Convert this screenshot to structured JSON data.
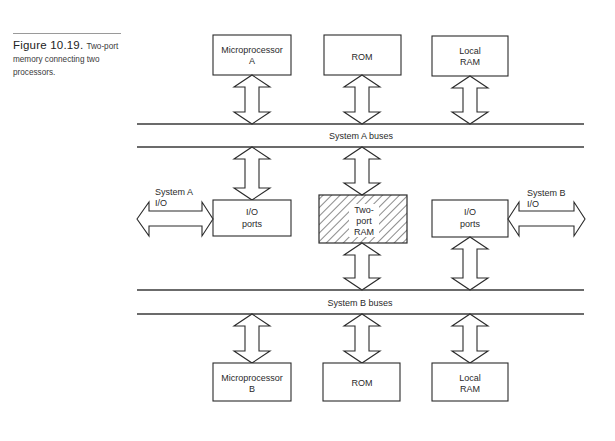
{
  "caption": {
    "figure_number": "Figure 10.19.",
    "text": "Two-port memory connecting two processors."
  },
  "buses": {
    "system_a": "System A buses",
    "system_b": "System B buses"
  },
  "top_row": {
    "microprocessor": [
      "Microprocessor",
      "A"
    ],
    "rom": "ROM",
    "local_ram": [
      "Local",
      "RAM"
    ]
  },
  "middle_row": {
    "io_ports_a": [
      "I/O",
      "ports"
    ],
    "two_port_ram": [
      "Two-",
      "port",
      "RAM"
    ],
    "io_ports_b": [
      "I/O",
      "ports"
    ],
    "system_a_io": [
      "System A",
      "I/O"
    ],
    "system_b_io": [
      "System B",
      "I/O"
    ]
  },
  "bottom_row": {
    "microprocessor": [
      "Microprocessor",
      "B"
    ],
    "rom": "ROM",
    "local_ram": [
      "Local",
      "RAM"
    ]
  },
  "colors": {
    "line": "#2a2a2a",
    "background": "#ffffff"
  }
}
